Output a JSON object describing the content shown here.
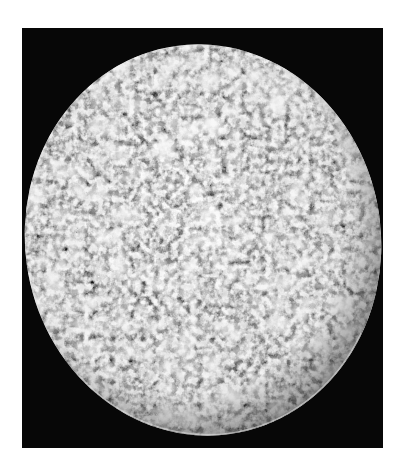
{
  "caption": {
    "text": "",
    "note": "cut off at top edge; only descenders visible"
  },
  "photo": {
    "subject": "cratered moon",
    "color_mode": "grayscale",
    "background": "#070707",
    "page_background": "#ffffff",
    "frame": {
      "x": 22,
      "y": 28,
      "width": 361,
      "height": 420
    },
    "moon": {
      "cx": 181,
      "cy": 212,
      "rx": 178,
      "ry": 196,
      "rotation_deg": -8
    }
  }
}
